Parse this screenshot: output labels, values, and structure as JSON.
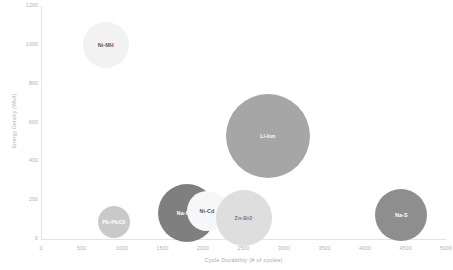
{
  "chart_data": {
    "type": "scatter",
    "title": "",
    "xlabel": "Cycle Durability (# of cycles)",
    "ylabel": "Energy Density (Wh/l)",
    "xlim": [
      0,
      5000
    ],
    "ylim": [
      0,
      1200
    ],
    "grid": false,
    "legend": "none",
    "xticks": [
      "0",
      "500",
      "1000",
      "1500",
      "2000",
      "2500",
      "3000",
      "3500",
      "4000",
      "4500",
      "5000"
    ],
    "xtick_values": [
      0,
      500,
      1000,
      1500,
      2000,
      2500,
      3000,
      3500,
      4000,
      4500,
      5000
    ],
    "yticks": [
      "0",
      "200",
      "400",
      "600",
      "800",
      "1000",
      "1200"
    ],
    "ytick_values": [
      0,
      200,
      400,
      600,
      800,
      1000,
      1200
    ],
    "points": [
      {
        "label": "Ni-MH",
        "x": 800,
        "y": 1000,
        "radius_px": 23,
        "color": "#f2f2f2",
        "label_color": "#595959"
      },
      {
        "label": "Pb-PbO2",
        "x": 900,
        "y": 85,
        "radius_px": 16,
        "color": "#c9c9c9",
        "label_color": "#ffffff"
      },
      {
        "label": "Na-NiCl",
        "x": 1800,
        "y": 135,
        "radius_px": 29,
        "color": "#7f7f7f",
        "label_color": "#ffffff"
      },
      {
        "label": "Ni-Cd",
        "x": 2050,
        "y": 145,
        "radius_px": 20,
        "color": "#f7f7f7",
        "label_color": "#595959"
      },
      {
        "label": "Zn-Br2",
        "x": 2500,
        "y": 110,
        "radius_px": 28,
        "color": "#dedede",
        "label_color": "#7a7a7a"
      },
      {
        "label": "Li-Ion",
        "x": 2800,
        "y": 530,
        "radius_px": 42,
        "color": "#a6a6a6",
        "label_color": "#ffffff"
      },
      {
        "label": "Na-S",
        "x": 4450,
        "y": 125,
        "radius_px": 26,
        "color": "#8e8e8e",
        "label_color": "#ffffff"
      }
    ]
  },
  "axes": {
    "x_title": "Cycle Durability (# of cycles)",
    "y_title": "Energy Density (Wh/l)"
  },
  "colors": {
    "axis_line": "#e3e3e3",
    "tick_text": "#b0b0b0",
    "axis_title_text": "#a8a8a8",
    "background": "#ffffff"
  }
}
